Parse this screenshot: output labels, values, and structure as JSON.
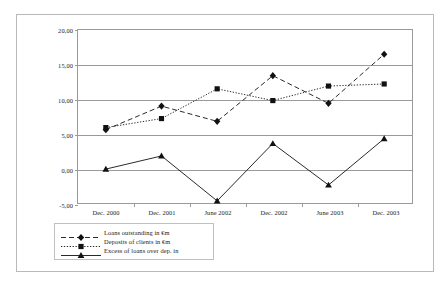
{
  "chart_data": {
    "type": "line",
    "title": "",
    "xlabel": "",
    "ylabel": "",
    "ylim": [
      -5,
      20
    ],
    "yticks": [
      "20,00",
      "15,00",
      "10,00",
      "5,00",
      "0,00",
      "-5,00"
    ],
    "ytick_values": [
      20,
      15,
      10,
      5,
      0,
      -5
    ],
    "grid": "horizontal",
    "legend_position": "below-left",
    "categories": [
      "Dec. 2000",
      "Dec. 2001",
      "June 2002",
      "Dec. 2002",
      "June 2003",
      "Dec. 2003"
    ],
    "series": [
      {
        "name": "Loans outstanding in €m",
        "marker": "diamond",
        "linestyle": "dashed",
        "color": "#111111",
        "values": [
          5.6,
          9.0,
          6.8,
          13.4,
          9.4,
          16.5
        ]
      },
      {
        "name": "Deposits of clients in €m",
        "marker": "square",
        "linestyle": "dotted",
        "color": "#111111",
        "values": [
          5.9,
          7.2,
          11.5,
          9.8,
          11.9,
          12.2
        ]
      },
      {
        "name": "Excess of loans over dep. in",
        "marker": "triangle",
        "linestyle": "solid",
        "color": "#111111",
        "values": [
          -0.1,
          1.8,
          -4.7,
          3.6,
          -2.4,
          4.3
        ]
      }
    ]
  }
}
